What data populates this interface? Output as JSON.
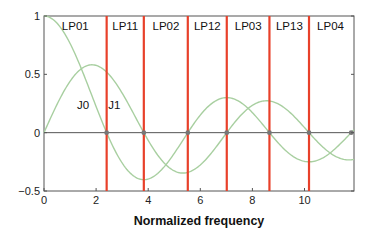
{
  "chart_data": {
    "type": "line",
    "title": "",
    "xlabel": "Normalized frequency",
    "ylabel": "",
    "xlim": [
      0,
      11.9
    ],
    "ylim": [
      -0.5,
      1
    ],
    "x_ticks": [
      0,
      2,
      4,
      6,
      8,
      10
    ],
    "y_ticks": [
      -0.5,
      0,
      0.5,
      1
    ],
    "y_tick_labels": [
      "−0.5",
      "0",
      "0.5",
      "1"
    ],
    "grid": false,
    "series": [
      {
        "name": "J0",
        "function": "bessel_j0",
        "color": "#a8cfa0",
        "label_pos": [
          1.5,
          0.2
        ]
      },
      {
        "name": "J1",
        "function": "bessel_j1",
        "color": "#a8cfa0",
        "label_pos": [
          2.7,
          0.2
        ]
      }
    ],
    "cutoff_lines": {
      "color": "#e8402a",
      "x": [
        2.405,
        3.832,
        5.52,
        7.016,
        8.654,
        10.173
      ]
    },
    "zero_crossing_markers": [
      2.405,
      3.832,
      5.52,
      7.016,
      8.654,
      10.173,
      11.792
    ],
    "mode_regions": [
      {
        "label": "LP01",
        "x": 1.2
      },
      {
        "label": "LP11",
        "x": 3.12
      },
      {
        "label": "LP02",
        "x": 4.68
      },
      {
        "label": "LP12",
        "x": 6.27
      },
      {
        "label": "LP03",
        "x": 7.84
      },
      {
        "label": "LP13",
        "x": 9.42
      },
      {
        "label": "LP04",
        "x": 11.0
      }
    ]
  }
}
